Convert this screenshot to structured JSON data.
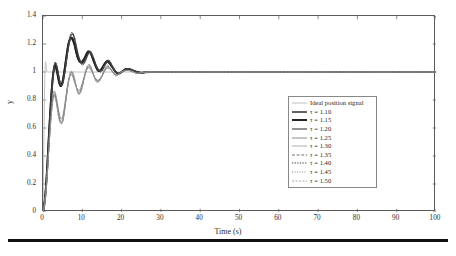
{
  "figure": {
    "background": "#ffffff",
    "frame_color": "#5a5a5a",
    "bottom_rule_color": "#111111"
  },
  "axes": {
    "x_title": "Time (s)",
    "y_title": "y",
    "x_ticks": [
      "0",
      "10",
      "20",
      "30",
      "40",
      "50",
      "60",
      "70",
      "80",
      "90",
      "100"
    ],
    "y_ticks": [
      "0",
      "0.2",
      "0.4",
      "0.6",
      "0.8",
      "1",
      "1.2",
      "1.4"
    ]
  },
  "legend": {
    "entries": [
      {
        "label": "Ideal position signal",
        "color": "#b9b9b9",
        "dash": "none",
        "width": 0.9
      },
      {
        "label": "τ = 1.10",
        "color": "#2f2f2f",
        "dash": "none",
        "width": 1.5
      },
      {
        "label": "τ = 1.15",
        "color": "#232323",
        "dash": "none",
        "width": 2.0
      },
      {
        "label": "τ = 1.20",
        "color": "#4a4a4a",
        "dash": "none",
        "width": 1.2
      },
      {
        "label": "τ = 1.25",
        "color": "#8a8a8a",
        "dash": "none",
        "width": 1.0
      },
      {
        "label": "τ = 1.30",
        "color": "#a6a6a6",
        "dash": "none",
        "width": 0.9
      },
      {
        "label": "τ = 1.35",
        "color": "#6f6f6f",
        "dash": "3,1.6",
        "width": 1.0
      },
      {
        "label": "τ = 1.40",
        "color": "#3d3d3d",
        "dash": "1.3,1.3",
        "width": 1.0
      },
      {
        "label": "τ = 1.45",
        "color": "#7d7d7d",
        "dash": "1.1,1.4",
        "width": 0.9
      },
      {
        "label": "τ = 1.50",
        "color": "#9c9c9c",
        "dash": "2,1.5",
        "width": 0.9
      }
    ]
  },
  "chart_data": {
    "type": "line",
    "title": "",
    "xlabel": "Time (s)",
    "ylabel": "y",
    "xlim": [
      0,
      100
    ],
    "ylim": [
      0,
      1.4
    ],
    "xticks": [
      0,
      10,
      20,
      30,
      40,
      50,
      60,
      70,
      80,
      90,
      100
    ],
    "yticks": [
      0,
      0.2,
      0.4,
      0.6,
      0.8,
      1.0,
      1.2,
      1.4
    ],
    "grid": false,
    "legend_position": "center-right",
    "x": [
      0,
      0.5,
      1,
      1.5,
      2,
      2.5,
      3,
      3.5,
      4,
      4.5,
      5,
      5.5,
      6,
      6.5,
      7,
      7.5,
      8,
      8.5,
      9,
      9.5,
      10,
      10.5,
      11,
      11.5,
      12,
      12.5,
      13,
      13.5,
      14,
      14.5,
      15,
      15.5,
      16,
      16.5,
      17,
      17.5,
      18,
      18.5,
      19,
      19.5,
      20,
      21,
      22,
      23,
      24,
      25,
      26,
      27,
      28,
      29,
      30,
      35,
      40,
      50,
      60,
      70,
      80,
      90,
      100
    ],
    "series": [
      {
        "name": "Ideal position signal",
        "color": "#b9b9b9",
        "dash": "none",
        "values": [
          0,
          1,
          1,
          1,
          1,
          1,
          1,
          1,
          1,
          1,
          1,
          1,
          1,
          1,
          1,
          1,
          1,
          1,
          1,
          1,
          1,
          1,
          1,
          1,
          1,
          1,
          1,
          1,
          1,
          1,
          1,
          1,
          1,
          1,
          1,
          1,
          1,
          1,
          1,
          1,
          1,
          1,
          1,
          1,
          1,
          1,
          1,
          1,
          1,
          1,
          1,
          1,
          1,
          1,
          1,
          1,
          1,
          1,
          1
        ]
      },
      {
        "name": "τ = 1.10",
        "color": "#2f2f2f",
        "dash": "none",
        "values": [
          0,
          0.1,
          0.3,
          0.56,
          0.8,
          0.97,
          1.04,
          1.0,
          0.93,
          0.9,
          0.94,
          1.03,
          1.13,
          1.21,
          1.24,
          1.23,
          1.19,
          1.13,
          1.09,
          1.07,
          1.08,
          1.1,
          1.13,
          1.15,
          1.14,
          1.11,
          1.07,
          1.03,
          1.01,
          1.01,
          1.03,
          1.05,
          1.07,
          1.07,
          1.06,
          1.04,
          1.02,
          1.0,
          0.99,
          0.99,
          1.0,
          1.02,
          1.02,
          1.01,
          1.0,
          0.995,
          0.998,
          1.0,
          1.0,
          1.0,
          1.0,
          1.0,
          1.0,
          1.0,
          1.0,
          1.0,
          1.0,
          1.0,
          1.0
        ]
      },
      {
        "name": "τ = 1.15",
        "color": "#232323",
        "dash": "none",
        "values": [
          0,
          0.09,
          0.28,
          0.54,
          0.78,
          0.96,
          1.05,
          1.02,
          0.95,
          0.9,
          0.93,
          1.01,
          1.11,
          1.2,
          1.24,
          1.24,
          1.2,
          1.14,
          1.09,
          1.07,
          1.07,
          1.09,
          1.12,
          1.14,
          1.14,
          1.11,
          1.07,
          1.04,
          1.01,
          1.01,
          1.02,
          1.05,
          1.07,
          1.08,
          1.06,
          1.04,
          1.02,
          1.0,
          0.99,
          0.99,
          1.0,
          1.02,
          1.02,
          1.01,
          1.0,
          0.995,
          0.998,
          1.0,
          1.0,
          1.0,
          1.0,
          1.0,
          1.0,
          1.0,
          1.0,
          1.0,
          1.0,
          1.0,
          1.0
        ]
      },
      {
        "name": "τ = 1.20",
        "color": "#4a4a4a",
        "dash": "none",
        "values": [
          0,
          0.09,
          0.27,
          0.52,
          0.76,
          0.95,
          1.06,
          1.04,
          0.97,
          0.91,
          0.92,
          0.99,
          1.09,
          1.18,
          1.25,
          1.27,
          1.24,
          1.18,
          1.12,
          1.08,
          1.06,
          1.07,
          1.1,
          1.13,
          1.14,
          1.12,
          1.09,
          1.05,
          1.02,
          1.01,
          1.01,
          1.04,
          1.06,
          1.08,
          1.07,
          1.05,
          1.02,
          1.0,
          0.99,
          0.99,
          1.0,
          1.02,
          1.02,
          1.01,
          1.0,
          0.995,
          0.998,
          1.0,
          1.0,
          1.0,
          1.0,
          1.0,
          1.0,
          1.0,
          1.0,
          1.0,
          1.0,
          1.0,
          1.0
        ]
      },
      {
        "name": "τ = 1.25",
        "color": "#8a8a8a",
        "dash": "none",
        "values": [
          0,
          0.08,
          0.25,
          0.48,
          0.7,
          0.84,
          0.86,
          0.8,
          0.72,
          0.67,
          0.68,
          0.76,
          0.86,
          0.94,
          0.98,
          0.97,
          0.93,
          0.89,
          0.87,
          0.88,
          0.92,
          0.97,
          1.01,
          1.03,
          1.02,
          1.0,
          0.97,
          0.95,
          0.94,
          0.95,
          0.97,
          1.0,
          1.02,
          1.03,
          1.02,
          1.01,
          0.99,
          0.98,
          0.98,
          0.99,
          1.0,
          1.01,
          1.01,
          1.0,
          0.99,
          0.995,
          0.998,
          1.0,
          1.0,
          1.0,
          1.0,
          1.0,
          1.0,
          1.0,
          1.0,
          1.0,
          1.0,
          1.0,
          1.0
        ]
      },
      {
        "name": "τ = 1.30",
        "color": "#a6a6a6",
        "dash": "none",
        "values": [
          0,
          0.08,
          0.24,
          0.47,
          0.68,
          0.82,
          0.85,
          0.79,
          0.7,
          0.65,
          0.66,
          0.74,
          0.84,
          0.93,
          0.98,
          0.98,
          0.94,
          0.89,
          0.86,
          0.87,
          0.91,
          0.96,
          1.01,
          1.03,
          1.03,
          1.0,
          0.97,
          0.94,
          0.94,
          0.95,
          0.97,
          1.0,
          1.02,
          1.03,
          1.03,
          1.01,
          0.99,
          0.98,
          0.98,
          0.99,
          1.0,
          1.01,
          1.01,
          1.0,
          0.99,
          0.995,
          0.998,
          1.0,
          1.0,
          1.0,
          1.0,
          1.0,
          1.0,
          1.0,
          1.0,
          1.0,
          1.0,
          1.0,
          1.0
        ]
      },
      {
        "name": "τ = 1.35",
        "color": "#6f6f6f",
        "dash": "3,1.6",
        "values": [
          0,
          0.08,
          0.24,
          0.46,
          0.67,
          0.81,
          0.84,
          0.78,
          0.69,
          0.64,
          0.65,
          0.73,
          0.84,
          0.93,
          0.99,
          0.99,
          0.95,
          0.89,
          0.85,
          0.86,
          0.9,
          0.96,
          1.01,
          1.04,
          1.04,
          1.01,
          0.97,
          0.94,
          0.93,
          0.95,
          0.97,
          1.0,
          1.03,
          1.04,
          1.03,
          1.01,
          0.99,
          0.98,
          0.98,
          0.99,
          1.0,
          1.01,
          1.01,
          1.0,
          0.99,
          0.995,
          0.998,
          1.0,
          1.0,
          1.0,
          1.0,
          1.0,
          1.0,
          1.0,
          1.0,
          1.0,
          1.0,
          1.0,
          1.0
        ]
      },
      {
        "name": "τ = 1.40",
        "color": "#3d3d3d",
        "dash": "1.3,1.3",
        "values": [
          0,
          0.09,
          0.27,
          0.51,
          0.75,
          0.94,
          1.06,
          1.05,
          0.98,
          0.91,
          0.91,
          0.98,
          1.08,
          1.19,
          1.27,
          1.28,
          1.25,
          1.18,
          1.11,
          1.07,
          1.05,
          1.06,
          1.09,
          1.13,
          1.15,
          1.13,
          1.09,
          1.05,
          1.02,
          1.0,
          1.01,
          1.03,
          1.06,
          1.08,
          1.08,
          1.05,
          1.03,
          1.0,
          0.99,
          0.99,
          1.0,
          1.02,
          1.02,
          1.01,
          1.0,
          0.995,
          0.998,
          1.0,
          1.0,
          1.0,
          1.0,
          1.0,
          1.0,
          1.0,
          1.0,
          1.0,
          1.0,
          1.0,
          1.0
        ]
      },
      {
        "name": "τ = 1.45",
        "color": "#7d7d7d",
        "dash": "1.1,1.4",
        "values": [
          0,
          0.08,
          0.24,
          0.46,
          0.66,
          0.8,
          0.83,
          0.77,
          0.68,
          0.64,
          0.65,
          0.73,
          0.84,
          0.94,
          0.99,
          1.0,
          0.95,
          0.89,
          0.85,
          0.85,
          0.9,
          0.96,
          1.02,
          1.05,
          1.04,
          1.01,
          0.97,
          0.94,
          0.93,
          0.94,
          0.97,
          1.01,
          1.03,
          1.04,
          1.03,
          1.01,
          0.99,
          0.98,
          0.98,
          0.99,
          1.0,
          1.01,
          1.01,
          1.0,
          0.99,
          0.995,
          0.998,
          1.0,
          1.0,
          1.0,
          1.0,
          1.0,
          1.0,
          1.0,
          1.0,
          1.0,
          1.0,
          1.0,
          1.0
        ]
      },
      {
        "name": "τ = 1.50",
        "color": "#9c9c9c",
        "dash": "2,1.5",
        "values": [
          0,
          0.08,
          0.23,
          0.45,
          0.65,
          0.79,
          0.82,
          0.76,
          0.67,
          0.63,
          0.64,
          0.72,
          0.83,
          0.93,
          1.0,
          1.0,
          0.96,
          0.89,
          0.84,
          0.85,
          0.89,
          0.96,
          1.02,
          1.05,
          1.05,
          1.01,
          0.97,
          0.93,
          0.93,
          0.94,
          0.97,
          1.01,
          1.04,
          1.05,
          1.03,
          1.01,
          0.99,
          0.97,
          0.98,
          0.99,
          1.0,
          1.01,
          1.01,
          1.0,
          0.99,
          0.995,
          0.998,
          1.0,
          1.0,
          1.0,
          1.0,
          1.0,
          1.0,
          1.0,
          1.0,
          1.0,
          1.0,
          1.0,
          1.0
        ]
      }
    ]
  }
}
